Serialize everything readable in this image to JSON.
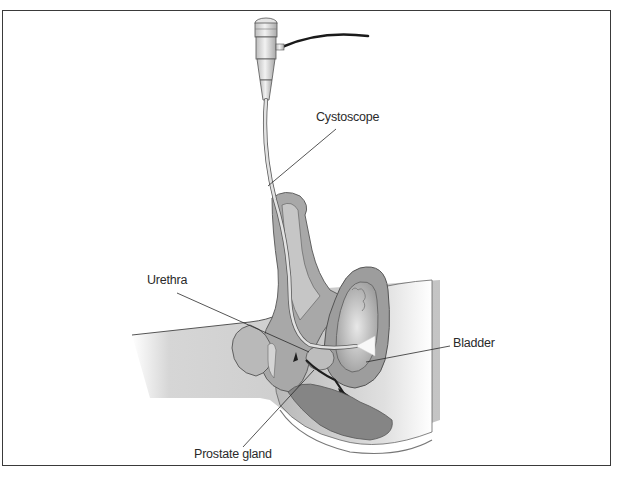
{
  "figure": {
    "type": "anatomical-illustration",
    "labels": {
      "cystoscope": "Cystoscope",
      "urethra": "Urethra",
      "bladder": "Bladder",
      "prostate": "Prostate gland"
    }
  },
  "colors": {
    "frame": "#3a3a3a",
    "tissue_light": "#cfcfcf",
    "tissue_mid": "#a8a8a8",
    "tissue_dark": "#8a8a8a",
    "outline": "#555555",
    "instrument": "#d9d9d9",
    "cable": "#1a1a1a"
  }
}
